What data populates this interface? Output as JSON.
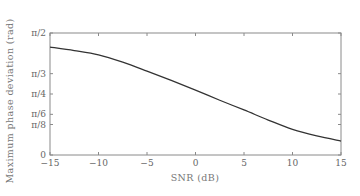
{
  "chart_data": {
    "type": "line",
    "title": "",
    "xlabel": "SNR (dB)",
    "ylabel": "Maximum phase deviation (rad)",
    "xlim": [
      -15,
      15
    ],
    "ylim": [
      0,
      1.5708
    ],
    "grid": false,
    "legend": null,
    "x_ticks": [
      {
        "value": -15,
        "label": "−15"
      },
      {
        "value": -10,
        "label": "−10"
      },
      {
        "value": -5,
        "label": "−5"
      },
      {
        "value": 0,
        "label": "0"
      },
      {
        "value": 5,
        "label": "5"
      },
      {
        "value": 10,
        "label": "10"
      },
      {
        "value": 15,
        "label": "15"
      }
    ],
    "y_ticks": [
      {
        "value": 0,
        "label": "0"
      },
      {
        "value": 0.3927,
        "label": "π/8"
      },
      {
        "value": 0.5236,
        "label": "π/6"
      },
      {
        "value": 0.7854,
        "label": "π/4"
      },
      {
        "value": 1.0472,
        "label": "π/3"
      },
      {
        "value": 1.5708,
        "label": "π/2"
      }
    ],
    "series": [
      {
        "name": "Maximum phase deviation",
        "color": "#333333",
        "x": [
          -15,
          -12.5,
          -10,
          -7.5,
          -5,
          -2.5,
          0,
          2.5,
          5,
          7.5,
          10,
          12.5,
          15
        ],
        "y": [
          1.39,
          1.345,
          1.29,
          1.195,
          1.08,
          0.96,
          0.835,
          0.705,
          0.58,
          0.45,
          0.33,
          0.245,
          0.18
        ]
      }
    ]
  },
  "colors": {
    "axis": "#8a8a8a",
    "curve": "#333333",
    "text": "#666666"
  }
}
